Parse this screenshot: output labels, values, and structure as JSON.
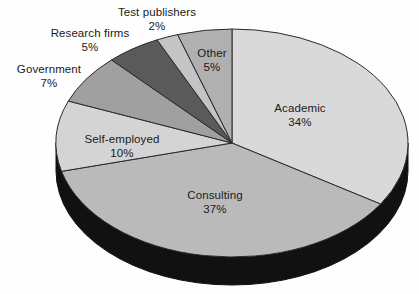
{
  "chart_data": {
    "type": "pie",
    "title": "",
    "subtitle": "",
    "xlabel": "",
    "ylabel": "",
    "legend_position": "labels-on-slices",
    "grid": false,
    "three_d": true,
    "start_angle_deg": 0,
    "direction": "clockwise",
    "categories": [
      "Academic",
      "Consulting",
      "Self-employed",
      "Government",
      "Research firms",
      "Test publishers",
      "Other"
    ],
    "values": [
      34,
      37,
      10,
      7,
      5,
      2,
      5
    ],
    "value_labels": [
      "34%",
      "37%",
      "10%",
      "7%",
      "5%",
      "2%",
      "5%"
    ],
    "unit": "%",
    "total": 100,
    "slices": [
      {
        "name": "Academic",
        "value": 34,
        "value_label": "34%",
        "color": "#d9d9d9",
        "label_placement": "inside"
      },
      {
        "name": "Consulting",
        "value": 37,
        "value_label": "37%",
        "color": "#bababa",
        "label_placement": "inside"
      },
      {
        "name": "Self-employed",
        "value": 10,
        "value_label": "10%",
        "color": "#d4d4d4",
        "label_placement": "inside"
      },
      {
        "name": "Government",
        "value": 7,
        "value_label": "7%",
        "color": "#a0a0a0",
        "label_placement": "outside"
      },
      {
        "name": "Research firms",
        "value": 5,
        "value_label": "5%",
        "color": "#5a5a5a",
        "label_placement": "outside"
      },
      {
        "name": "Test publishers",
        "value": 2,
        "value_label": "2%",
        "color": "#c4c4c4",
        "label_placement": "outside"
      },
      {
        "name": "Other",
        "value": 5,
        "value_label": "5%",
        "color": "#b0b0b0",
        "label_placement": "inside"
      }
    ],
    "colors": {
      "background": "#fefefe",
      "base_3d": "#111111",
      "slice_outline": "#2a2a2a",
      "label_text": "#1a1a1a"
    }
  }
}
